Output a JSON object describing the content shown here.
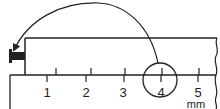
{
  "diagram": {
    "scale": {
      "unit": "mm",
      "labels": [
        "1",
        "2",
        "3",
        "4",
        "5"
      ],
      "highlighted_label": "4"
    },
    "colors": {
      "stroke": "#222222",
      "background": "#ffffff"
    }
  }
}
